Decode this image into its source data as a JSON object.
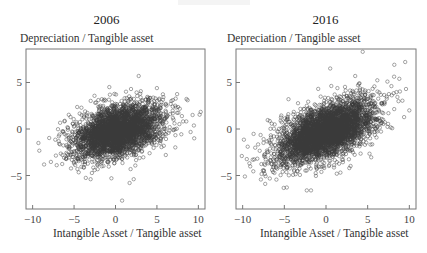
{
  "chart_data": [
    {
      "type": "scatter",
      "title": "2006",
      "xlabel": "Intangible Asset / Tangible asset",
      "ylabel": "Depreciation / Tangible asset",
      "xlim": [
        -10.8,
        10.8
      ],
      "ylim": [
        -8.6,
        8.6
      ],
      "xticks": [
        -10,
        -5,
        0,
        5,
        10
      ],
      "yticks": [
        5,
        0,
        -5
      ],
      "xtick_labels": [
        "−10",
        "−5",
        "0",
        "5",
        "10"
      ],
      "ytick_labels": [
        "5",
        "0",
        "−5"
      ],
      "grid": false,
      "marker": "open-circle",
      "marker_color": "#3a3a3a",
      "cluster": {
        "n": 3200,
        "mean_x": 0.3,
        "mean_y": -0.2,
        "sd_x": 2.6,
        "sd_y": 1.35,
        "slope": 0.22,
        "seed": 2006
      },
      "outliers": [
        [
          2.8,
          5.7
        ],
        [
          5.0,
          4.4
        ],
        [
          9.3,
          1.5
        ],
        [
          9.5,
          -1.0
        ],
        [
          -9.3,
          -1.5
        ],
        [
          0.8,
          -7.7
        ],
        [
          -5.0,
          -3.7
        ],
        [
          -3.0,
          -5.4
        ],
        [
          7.2,
          2.5
        ],
        [
          8.7,
          3.1
        ],
        [
          6.6,
          1.6
        ],
        [
          -6.2,
          -3.1
        ],
        [
          -4.6,
          -4.3
        ],
        [
          1.7,
          -5.8
        ],
        [
          2.2,
          -5.4
        ],
        [
          -0.5,
          -5.3
        ]
      ]
    },
    {
      "type": "scatter",
      "title": "2016",
      "xlabel": "Intangible Asset / Tangible asset",
      "ylabel": "Depreciation / Tangible asset",
      "xlim": [
        -10.8,
        10.8
      ],
      "ylim": [
        -8.6,
        8.6
      ],
      "xticks": [
        -10,
        -5,
        0,
        5,
        10
      ],
      "yticks": [
        5,
        0,
        -5
      ],
      "xtick_labels": [
        "−10",
        "−5",
        "0",
        "5",
        "10"
      ],
      "ytick_labels": [
        "5",
        "0",
        "−5"
      ],
      "grid": false,
      "marker": "open-circle",
      "marker_color": "#3a3a3a",
      "cluster": {
        "n": 3800,
        "mean_x": 0.0,
        "mean_y": -0.3,
        "sd_x": 2.9,
        "sd_y": 1.4,
        "slope": 0.32,
        "seed": 2016
      },
      "outliers": [
        [
          4.4,
          8.3
        ],
        [
          0.5,
          6.5
        ],
        [
          9.5,
          7.2
        ],
        [
          10.0,
          2.0
        ],
        [
          -7.3,
          -5.9
        ],
        [
          -2.3,
          -6.6
        ],
        [
          -1.8,
          -6.6
        ],
        [
          -9.4,
          -1.9
        ],
        [
          8.2,
          6.9
        ],
        [
          8.8,
          5.4
        ],
        [
          9.6,
          4.3
        ],
        [
          -4.5,
          3.2
        ],
        [
          -10.1,
          -2.9
        ],
        [
          -8.8,
          -3.3
        ],
        [
          -5.2,
          -4.6
        ],
        [
          1.3,
          -4.8
        ],
        [
          2.8,
          -4.2
        ]
      ]
    }
  ]
}
